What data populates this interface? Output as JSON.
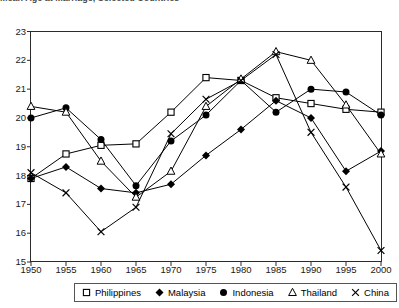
{
  "title_partial": "Mean Age at Marriage, Selected Countries",
  "legend": {
    "position": "bottom",
    "items": [
      {
        "label": "Philippines",
        "marker": "open-square",
        "key": "philippines"
      },
      {
        "label": "Malaysia",
        "marker": "filled-diamond",
        "key": "malaysia"
      },
      {
        "label": "Indonesia",
        "marker": "filled-circle",
        "key": "indonesia"
      },
      {
        "label": "Thailand",
        "marker": "open-triangle",
        "key": "thailand"
      },
      {
        "label": "China",
        "marker": "cross-x",
        "key": "china"
      }
    ]
  },
  "y_ticks": [
    "23",
    "22",
    "21",
    "20",
    "19",
    "18",
    "17",
    "16",
    "15"
  ],
  "x_ticks": [
    "1950",
    "1955",
    "1960",
    "1965",
    "1970",
    "1975",
    "1980",
    "1985",
    "1990",
    "1995",
    "2000"
  ],
  "chart_data": {
    "type": "line",
    "title": "Mean Age at Marriage, Selected Countries",
    "xlabel": "",
    "ylabel": "",
    "xlim": [
      1950,
      2000
    ],
    "ylim": [
      15,
      23
    ],
    "ytick_step": 1,
    "grid": false,
    "legend_position": "bottom",
    "x": [
      1950,
      1955,
      1960,
      1965,
      1970,
      1975,
      1980,
      1985,
      1990,
      1995,
      2000
    ],
    "series": [
      {
        "name": "Philippines",
        "marker": "open-square",
        "color": "#000000",
        "values": [
          17.9,
          18.75,
          19.05,
          19.1,
          20.2,
          21.4,
          21.3,
          20.7,
          20.5,
          20.3,
          20.2
        ]
      },
      {
        "name": "Malaysia",
        "marker": "filled-diamond",
        "color": "#000000",
        "values": [
          17.9,
          18.3,
          17.55,
          17.4,
          17.7,
          18.7,
          19.6,
          20.6,
          20.0,
          18.15,
          18.85
        ]
      },
      {
        "name": "Indonesia",
        "marker": "filled-circle",
        "color": "#000000",
        "values": [
          20.0,
          20.35,
          19.25,
          17.65,
          19.2,
          20.1,
          21.3,
          20.2,
          21.0,
          20.9,
          20.1
        ]
      },
      {
        "name": "Thailand",
        "marker": "open-triangle",
        "color": "#000000",
        "values": [
          20.4,
          20.2,
          18.5,
          17.25,
          18.15,
          20.4,
          21.35,
          22.3,
          22.0,
          20.45,
          18.75
        ]
      },
      {
        "name": "China",
        "marker": "cross-x",
        "color": "#000000",
        "values": [
          18.1,
          17.4,
          16.05,
          16.9,
          19.45,
          20.65,
          21.3,
          22.2,
          19.5,
          17.6,
          15.4
        ]
      }
    ]
  }
}
